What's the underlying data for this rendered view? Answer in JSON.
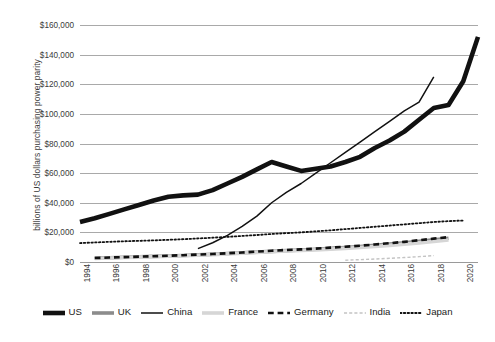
{
  "chart_data": {
    "type": "line",
    "title": "",
    "xlabel": "",
    "ylabel": "billions of US dollars purchasing power parity",
    "xlim": [
      1994,
      2021
    ],
    "ylim": [
      0,
      160000
    ],
    "y_ticks": [
      0,
      20000,
      40000,
      60000,
      80000,
      100000,
      120000,
      140000,
      160000
    ],
    "y_tick_labels": [
      "$0",
      "$20,000",
      "$40,000",
      "$60,000",
      "$80,000",
      "$100,000",
      "$120,000",
      "$140,000",
      "$160,000"
    ],
    "x_ticks": [
      1994,
      1996,
      1998,
      2000,
      2002,
      2004,
      2006,
      2008,
      2010,
      2012,
      2014,
      2016,
      2018,
      2020
    ],
    "x_tick_labels": [
      "1994",
      "1996",
      "1998",
      "2000",
      "2002",
      "2004",
      "2006",
      "2008",
      "2010",
      "2012",
      "2014",
      "2016",
      "2018",
      "2020"
    ],
    "grid": true,
    "grid_axis": "y",
    "legend_position": "bottom",
    "series": [
      {
        "name": "US",
        "color": "#111111",
        "style": "solid",
        "width": 4.6,
        "x": [
          1994,
          1995,
          1996,
          1997,
          1998,
          1999,
          2000,
          2001,
          2002,
          2003,
          2004,
          2005,
          2006,
          2007,
          2008,
          2009,
          2010,
          2011,
          2012,
          2013,
          2014,
          2015,
          2016,
          2017,
          2018,
          2019,
          2020,
          2021
        ],
        "values": [
          27000,
          29500,
          32500,
          35500,
          38500,
          41500,
          44000,
          45000,
          45500,
          48500,
          53000,
          57500,
          62500,
          67500,
          64500,
          61500,
          63000,
          64500,
          67500,
          71000,
          77000,
          82000,
          88000,
          96000,
          104000,
          106000,
          122000,
          152000
        ]
      },
      {
        "name": "UK",
        "color": "#8c8c8c",
        "style": "solid",
        "width": 3.6,
        "x": [
          1995,
          1996,
          1997,
          1998,
          1999,
          2000,
          2001,
          2002,
          2003,
          2004,
          2005,
          2006,
          2007,
          2008,
          2009,
          2010,
          2011,
          2012,
          2013,
          2014,
          2015,
          2016,
          2017,
          2018,
          2019
        ],
        "values": [
          2600,
          2900,
          3200,
          3500,
          3800,
          4100,
          4400,
          4800,
          5200,
          5700,
          6200,
          6700,
          7200,
          7700,
          8100,
          8600,
          9200,
          9800,
          10500,
          11300,
          12100,
          13000,
          14000,
          15000,
          16000
        ]
      },
      {
        "name": "China",
        "color": "#111111",
        "style": "solid",
        "width": 1.5,
        "x": [
          2002,
          2003,
          2004,
          2005,
          2006,
          2007,
          2008,
          2009,
          2010,
          2011,
          2012,
          2013,
          2014,
          2015,
          2016,
          2017,
          2018
        ],
        "values": [
          9000,
          13000,
          18000,
          24000,
          31000,
          40000,
          47000,
          53000,
          60000,
          67000,
          74000,
          81000,
          88000,
          95000,
          102000,
          108000,
          125000
        ]
      },
      {
        "name": "France",
        "color": "#d6d6d6",
        "style": "solid",
        "width": 3.6,
        "x": [
          1995,
          1996,
          1997,
          1998,
          1999,
          2000,
          2001,
          2002,
          2003,
          2004,
          2005,
          2006,
          2007,
          2008,
          2009,
          2010,
          2011,
          2012,
          2013,
          2014,
          2015,
          2016,
          2017,
          2018,
          2019
        ],
        "values": [
          2400,
          2700,
          3000,
          3300,
          3600,
          3900,
          4200,
          4600,
          5000,
          5500,
          6000,
          6500,
          7000,
          7400,
          7800,
          8200,
          8700,
          9200,
          9800,
          10500,
          11200,
          12000,
          12900,
          13800,
          14800
        ]
      },
      {
        "name": "Germany",
        "color": "#111111",
        "style": "dashed",
        "width": 2.6,
        "x": [
          1995,
          1996,
          1997,
          1998,
          1999,
          2000,
          2001,
          2002,
          2003,
          2004,
          2005,
          2006,
          2007,
          2008,
          2009,
          2010,
          2011,
          2012,
          2013,
          2014,
          2015,
          2016,
          2017,
          2018,
          2019
        ],
        "values": [
          2700,
          3000,
          3300,
          3600,
          3900,
          4200,
          4600,
          5000,
          5400,
          5900,
          6400,
          7000,
          7600,
          8100,
          8500,
          9000,
          9700,
          10300,
          11000,
          11800,
          12700,
          13600,
          14700,
          15800,
          16800
        ]
      },
      {
        "name": "India",
        "color": "#c4c4c4",
        "style": "dashed",
        "width": 1.4,
        "x": [
          2012,
          2013,
          2014,
          2015,
          2016,
          2017,
          2018
        ],
        "values": [
          1200,
          1600,
          2000,
          2500,
          3000,
          3600,
          4300
        ]
      },
      {
        "name": "Japan",
        "color": "#111111",
        "style": "dotted",
        "width": 1.8,
        "x": [
          1994,
          1995,
          1996,
          1997,
          1998,
          1999,
          2000,
          2001,
          2002,
          2003,
          2004,
          2005,
          2006,
          2007,
          2008,
          2009,
          2010,
          2011,
          2012,
          2013,
          2014,
          2015,
          2016,
          2017,
          2018,
          2019,
          2020
        ],
        "values": [
          12800,
          13200,
          13600,
          14000,
          14300,
          14600,
          15000,
          15400,
          15900,
          16400,
          17000,
          17600,
          18200,
          18900,
          19500,
          20000,
          20700,
          21400,
          22200,
          23000,
          23800,
          24600,
          25400,
          26200,
          27000,
          27600,
          28000
        ]
      }
    ]
  },
  "legend": {
    "items": [
      {
        "label": "US",
        "swatch": "thick-solid-black"
      },
      {
        "label": "UK",
        "swatch": "thick-solid-gray"
      },
      {
        "label": "China",
        "swatch": "thin-solid-black"
      },
      {
        "label": "France",
        "swatch": "thick-solid-lightgray"
      },
      {
        "label": "Germany",
        "swatch": "dashed-black"
      },
      {
        "label": "India",
        "swatch": "dashed-lightgray"
      },
      {
        "label": "Japan",
        "swatch": "dotted-black"
      }
    ]
  }
}
